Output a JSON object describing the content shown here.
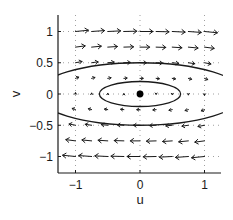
{
  "chart_data": {
    "type": "quiver",
    "title": "",
    "xlabel": "u",
    "ylabel": "v",
    "xlim": [
      -1.27,
      1.27
    ],
    "ylim": [
      -1.27,
      1.25
    ],
    "xticks": [
      -1,
      0,
      1
    ],
    "xtick_labels": [
      "−1",
      "0",
      "1"
    ],
    "yticks": [
      1,
      0.5,
      0,
      -0.5,
      -1
    ],
    "ytick_labels": [
      "1",
      "0.5",
      "0",
      "−0.5",
      "−1"
    ],
    "grid": "dotted",
    "vector_field": {
      "equations": [
        "u' = v",
        "v' = -0.1 u"
      ],
      "u_grid": [
        -1,
        -0.75,
        -0.5,
        -0.25,
        0,
        0.25,
        0.5,
        0.75,
        1
      ],
      "v_grid": [
        1,
        0.75,
        0.5,
        0.25,
        0,
        -0.25,
        -0.5,
        -0.75,
        -1
      ],
      "arrow_scale": 0.2
    },
    "equilibrium": {
      "u": 0,
      "v": 0,
      "marker": "filled-circle"
    },
    "level_curves": [
      {
        "name": "inner-orbit",
        "u_semi_axis": 0.63,
        "v_semi_axis": 0.2
      },
      {
        "name": "outer-orbit",
        "u_semi_axis": 1.6,
        "v_semi_axis": 0.5
      }
    ],
    "colors": {
      "ink": "#1a1a1a",
      "grid": "#888888",
      "background": "#ffffff"
    }
  }
}
